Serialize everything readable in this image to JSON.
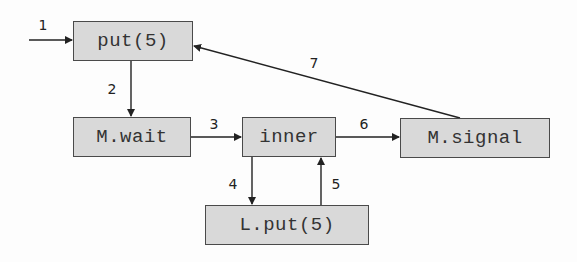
{
  "diagram": {
    "type": "flow",
    "nodes": [
      {
        "id": "put5",
        "label": "put(5)"
      },
      {
        "id": "mwait",
        "label": "M.wait"
      },
      {
        "id": "inner",
        "label": "inner"
      },
      {
        "id": "msignal",
        "label": "M.signal"
      },
      {
        "id": "lput5",
        "label": "L.put(5)"
      }
    ],
    "edges": [
      {
        "label": "1",
        "from": "entry",
        "to": "put5"
      },
      {
        "label": "2",
        "from": "put5",
        "to": "mwait"
      },
      {
        "label": "3",
        "from": "mwait",
        "to": "inner"
      },
      {
        "label": "4",
        "from": "inner",
        "to": "lput5"
      },
      {
        "label": "5",
        "from": "lput5",
        "to": "inner"
      },
      {
        "label": "6",
        "from": "inner",
        "to": "msignal"
      },
      {
        "label": "7",
        "from": "msignal",
        "to": "put5"
      }
    ]
  },
  "colors": {
    "node_fill": "#d9d9d9",
    "node_border": "#4a4a4a",
    "edge": "#222222",
    "text": "#333333"
  }
}
